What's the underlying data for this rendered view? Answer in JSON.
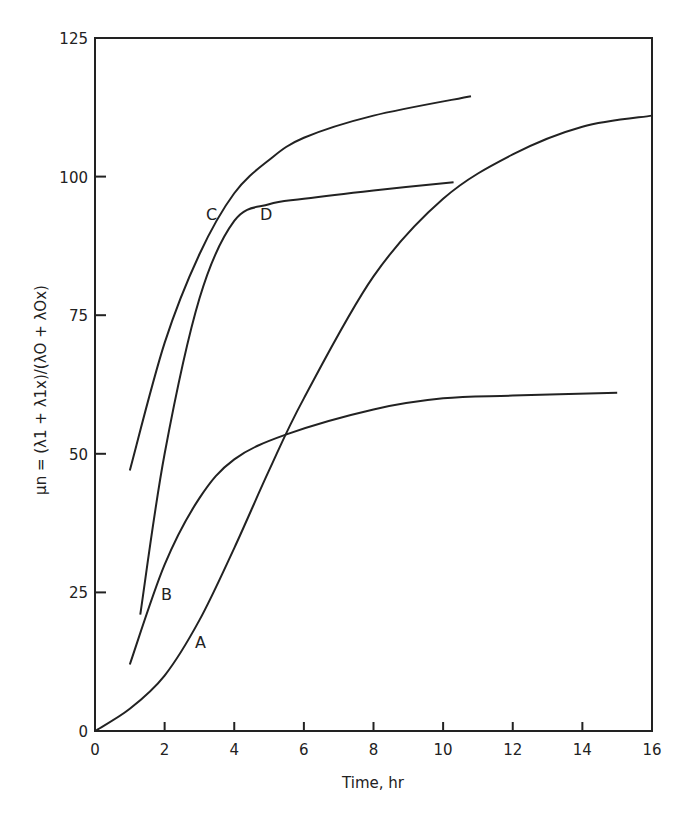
{
  "chart_data": {
    "type": "line",
    "title": "",
    "xlabel": "Time, hr",
    "ylabel": "μn = (λ1 + λ1x)/(λO + λOx)",
    "xlim": [
      0,
      16
    ],
    "ylim": [
      0,
      125
    ],
    "x_ticks": [
      "0",
      "2",
      "4",
      "6",
      "8",
      "10",
      "12",
      "14",
      "16"
    ],
    "y_ticks": [
      "0",
      "25",
      "50",
      "75",
      "100",
      "125"
    ],
    "grid": false,
    "legend": "inline curve labels",
    "series": [
      {
        "name": "A",
        "x": [
          0,
          1,
          2,
          3,
          4,
          5,
          6,
          8,
          10,
          12,
          14,
          16
        ],
        "y": [
          0,
          4,
          10,
          20,
          33,
          47,
          60,
          82,
          96,
          104,
          109,
          111
        ]
      },
      {
        "name": "B",
        "x": [
          1,
          2,
          3,
          4,
          5.5,
          8,
          10,
          12,
          15
        ],
        "y": [
          12,
          30,
          42,
          49,
          53.5,
          58,
          60,
          60.5,
          61
        ]
      },
      {
        "name": "C",
        "x": [
          1,
          2,
          3,
          4,
          5,
          6,
          8,
          10.8
        ],
        "y": [
          47,
          70,
          86,
          97,
          103,
          107,
          111,
          114.5
        ]
      },
      {
        "name": "D",
        "x": [
          1.3,
          2,
          3,
          4,
          5,
          6,
          8,
          10.3
        ],
        "y": [
          21,
          50,
          78,
          92,
          95,
          96,
          97.5,
          99
        ]
      }
    ]
  },
  "labels": {
    "A": "A",
    "B": "B",
    "C": "C",
    "D": "D"
  }
}
